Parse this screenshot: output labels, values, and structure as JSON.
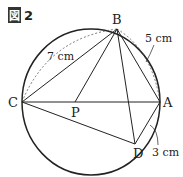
{
  "figure": {
    "label_glyph": "図",
    "label_number": "2"
  },
  "points": {
    "A": "A",
    "B": "B",
    "C": "C",
    "D": "D",
    "P": "P"
  },
  "measurements": {
    "BC": "7 cm",
    "AB": "5 cm",
    "AD": "3 cm"
  }
}
